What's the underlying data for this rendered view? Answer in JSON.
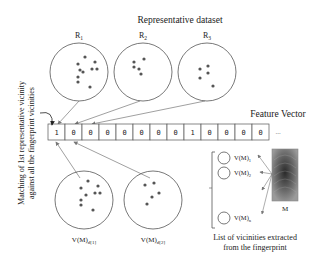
{
  "title": "Representative dataset",
  "representatives": [
    {
      "label": "R",
      "sub": "1"
    },
    {
      "label": "R",
      "sub": "2"
    },
    {
      "label": "R",
      "sub": "3"
    }
  ],
  "feature_vector": {
    "label": "Feature Vector",
    "values": [
      "1",
      "0",
      "0",
      "0",
      "0",
      "0",
      "0",
      "0",
      "1",
      "0",
      "0",
      "0",
      "0"
    ],
    "ellipsis": "..."
  },
  "side_label": {
    "line1": "Matching of 1st representative vicinity",
    "line2": "against all the fingerprint vicinities"
  },
  "matched_vicinities": [
    {
      "label": "V(M)",
      "sub": "d[1]"
    },
    {
      "label": "V(M)",
      "sub": "d[2]"
    }
  ],
  "vicinity_list": {
    "items": [
      {
        "label": "V(M)",
        "sub": "1"
      },
      {
        "label": "V(M)",
        "sub": "2"
      },
      {
        "label": "V(M)",
        "sub": "n"
      }
    ],
    "caption_line1": "List of vicinities extracted",
    "caption_line2": "from the fingerprint"
  },
  "fingerprint": {
    "label": "M"
  }
}
